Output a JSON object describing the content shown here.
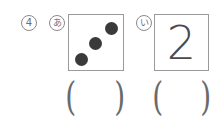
{
  "question": {
    "number_label": "④",
    "number_text": "4"
  },
  "items": [
    {
      "label": "あ",
      "type": "dots",
      "dot_count": 3,
      "answer_open": "(",
      "answer_close": ")"
    },
    {
      "label": "い",
      "type": "digit",
      "digit": "2",
      "answer_open": "(",
      "answer_close": ")"
    }
  ],
  "colors": {
    "dot": "#3a3a3a",
    "border": "#9a9a9a",
    "text": "#6e6e6e"
  }
}
